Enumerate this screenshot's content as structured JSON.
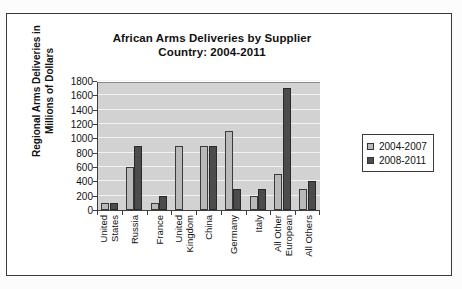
{
  "chart_data": {
    "type": "bar",
    "title": "African Arms Deliveries by Supplier Country: 2004-2011",
    "title_line1": "African Arms Deliveries by Supplier",
    "title_line2": "Country: 2004-2011",
    "xlabel": "",
    "ylabel": "Regional Arms Deliveries in Millions of Dollars",
    "ylabel_line1": "Regional Arms Deliveries in",
    "ylabel_line2": "Millions of Dollars",
    "ylim": [
      0,
      1800
    ],
    "ytick_step": 200,
    "yticks": [
      1800,
      1600,
      1400,
      1200,
      1000,
      800,
      600,
      400,
      200,
      0
    ],
    "grid": true,
    "legend_position": "right",
    "categories": [
      "United States",
      "Russia",
      "France",
      "United Kingdom",
      "China",
      "Germany",
      "Italy",
      "All Other European",
      "All Others"
    ],
    "category_lines": [
      [
        "United",
        "States"
      ],
      [
        "Russia"
      ],
      [
        "France"
      ],
      [
        "United",
        "Kingdom"
      ],
      [
        "China"
      ],
      [
        "Germany"
      ],
      [
        "Italy"
      ],
      [
        "All Other",
        "European"
      ],
      [
        "All Others"
      ]
    ],
    "series": [
      {
        "name": "2004-2007",
        "color": "#b9b9b9",
        "values": [
          100,
          600,
          100,
          900,
          900,
          1100,
          200,
          500,
          300
        ]
      },
      {
        "name": "2008-2011",
        "color": "#4c4c4c",
        "values": [
          100,
          900,
          200,
          0,
          900,
          300,
          300,
          1700,
          400
        ]
      }
    ]
  },
  "legend": {
    "items": [
      {
        "label": "2004-2007",
        "color": "#b9b9b9"
      },
      {
        "label": "2008-2011",
        "color": "#4c4c4c"
      }
    ]
  },
  "colors": {
    "plot_background": "#d2d2d2",
    "gridline": "#f2f2f2",
    "axis": "#3d3d3d",
    "text": "#111111",
    "frame": "#3a3a3a",
    "page_background": "#ffffff"
  }
}
